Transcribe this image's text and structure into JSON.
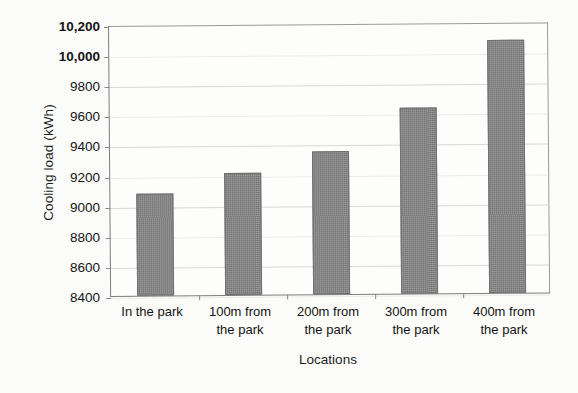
{
  "chart_data": {
    "type": "bar",
    "title": "",
    "subtitle": "",
    "xlabel": "Locations",
    "ylabel": "Cooling load (kWh)",
    "categories": [
      "In the park",
      "100m from the park",
      "200m from the park",
      "300m from the park",
      "400m from the park"
    ],
    "category_lines": [
      [
        "In the park"
      ],
      [
        "100m from",
        "the park"
      ],
      [
        "200m from",
        "the park"
      ],
      [
        "300m from",
        "the park"
      ],
      [
        "400m from",
        "the park"
      ]
    ],
    "values": [
      9080,
      9210,
      9350,
      9635,
      10080
    ],
    "ylim": [
      8400,
      10200
    ],
    "ytick_step": 200,
    "ytick_labels": [
      "10,200",
      "10,000",
      "9800",
      "9600",
      "9400",
      "9200",
      "9000",
      "8800",
      "8600",
      "8400"
    ],
    "ytick_values": [
      10200,
      10000,
      9800,
      9600,
      9400,
      9200,
      9000,
      8800,
      8600,
      8400
    ],
    "grid": true,
    "grid_axis": "y",
    "legend": false,
    "legend_position": "none",
    "series": [
      {
        "name": "Cooling load",
        "values": [
          9080,
          9210,
          9350,
          9635,
          10080
        ]
      }
    ],
    "colors": {
      "bar_fill": "#818181",
      "bar_border": "#6f6f6f",
      "gridline": "#d7d7d4",
      "axis": "#7d7d7b",
      "background": "#fbfbfa",
      "text": "#151515"
    }
  }
}
